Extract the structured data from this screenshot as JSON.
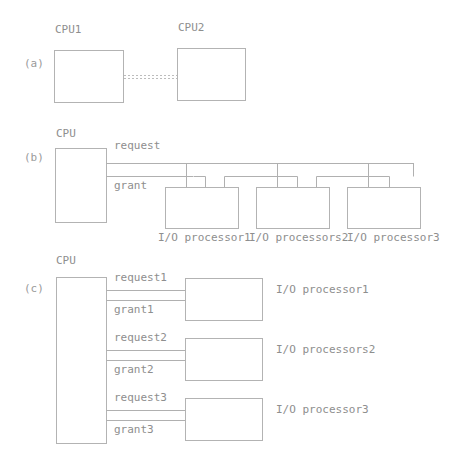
{
  "figure": {
    "line_color": "#b0b0b0",
    "box_stroke": "#b3b3b3",
    "text_color": "#8e8e8e",
    "background": "#ffffff"
  },
  "panel_a": {
    "id": "(a)",
    "boxes": [
      {
        "label": "CPU1"
      },
      {
        "label": "CPU2"
      }
    ],
    "connection_style": "dashed"
  },
  "panel_b": {
    "id": "(b)",
    "cpu_label": "CPU",
    "signals": [
      {
        "label": "request"
      },
      {
        "label": "grant"
      }
    ],
    "devices": [
      {
        "label": "I/O processor1"
      },
      {
        "label": "I/O processors2"
      },
      {
        "label": "I/O processor3"
      }
    ]
  },
  "panel_c": {
    "id": "(c)",
    "cpu_label": "CPU",
    "links": [
      {
        "request": "request1",
        "grant": "grant1",
        "device": "I/O processor1"
      },
      {
        "request": "request2",
        "grant": "grant2",
        "device": "I/O processors2"
      },
      {
        "request": "request3",
        "grant": "grant3",
        "device": "I/O processor3"
      }
    ]
  }
}
